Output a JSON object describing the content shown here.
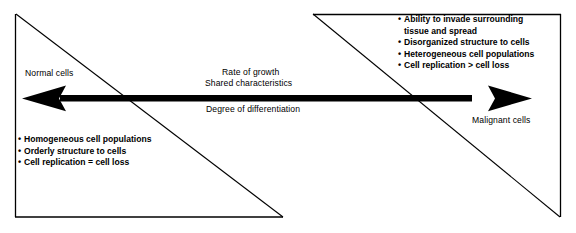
{
  "figure": {
    "kind": "continuum-diagram",
    "background_color": "#ffffff",
    "stroke_color": "#000000",
    "frame": {
      "left_triangle_name": "normal-cells-triangle",
      "right_triangle_name": "malignant-cells-triangle"
    }
  },
  "poles": {
    "left_label": "Normal cells",
    "right_label": "Malignant cells"
  },
  "axis": {
    "arrow_name": "double-headed-arrow",
    "above_labels": [
      "Rate of growth",
      "Shared characteristics"
    ],
    "below_labels": [
      "Degree of differentiation"
    ]
  },
  "normal_cells": {
    "title": "Normal cells",
    "bullets": [
      "Homogeneous cell populations",
      "Orderly structure to cells",
      "Cell replication = cell loss"
    ]
  },
  "malignant_cells": {
    "title": "Malignant cells",
    "bullets": [
      "Ability to invade surrounding\ntissue and spread",
      "Disorganized structure to cells",
      "Heterogeneous cell populations",
      "Cell replication > cell loss"
    ]
  },
  "bullet_glyph": "•"
}
